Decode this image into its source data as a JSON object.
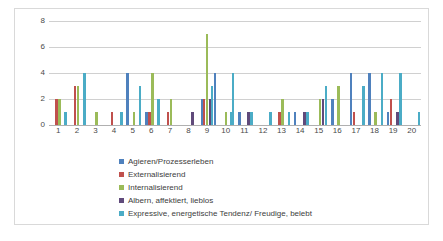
{
  "chart_data": {
    "type": "bar",
    "title": "",
    "subtitle": "",
    "xlabel": "",
    "ylabel": "",
    "ylim": [
      0,
      8
    ],
    "yticks": [
      0,
      2,
      4,
      6,
      8
    ],
    "grid": true,
    "legend_position": "bottom",
    "categories": [
      "1",
      "2",
      "3",
      "4",
      "5",
      "6",
      "7",
      "8",
      "9",
      "10",
      "11",
      "12",
      "13",
      "14",
      "15",
      "16",
      "17",
      "18",
      "19",
      "20"
    ],
    "series": [
      {
        "name": "Agieren/Prozesserleben",
        "color": "#4f81bd",
        "values": [
          0,
          0,
          0,
          0,
          4,
          1,
          0,
          0,
          2,
          0,
          1,
          0,
          0,
          1,
          0,
          2,
          4,
          4,
          1,
          0
        ]
      },
      {
        "name": "Externalisierend",
        "color": "#c0504d",
        "values": [
          2,
          3,
          0,
          1,
          0,
          1,
          1,
          0,
          2,
          0,
          0,
          0,
          1,
          0,
          0,
          0,
          1,
          0,
          2,
          0
        ]
      },
      {
        "name": "Internalisierend",
        "color": "#9bbb59",
        "values": [
          2,
          3,
          1,
          0,
          1,
          4,
          2,
          0,
          7,
          1,
          0,
          0,
          2,
          0,
          2,
          3,
          0,
          1,
          0,
          0
        ]
      },
      {
        "name": "Albern, affektiert, lieblos",
        "color": "#604a7b",
        "values": [
          0,
          0,
          0,
          0,
          0,
          0,
          0,
          1,
          2,
          0,
          1,
          0,
          0,
          1,
          2,
          0,
          0,
          0,
          1,
          0
        ]
      },
      {
        "name": "Expressive, energetische Tendenz/ Freudige, belebt",
        "color": "#4bacc6",
        "values": [
          1,
          4,
          0,
          1,
          3,
          2,
          0,
          0,
          3,
          1,
          1,
          1,
          1,
          1,
          3,
          0,
          3,
          4,
          4,
          1
        ]
      }
    ],
    "extra_bars": [
      {
        "category": "9",
        "series": "Agieren/Prozesserleben",
        "value": 4
      },
      {
        "category": "10",
        "series": "Expressive, energetische Tendenz/ Freudige, belebt",
        "value": 4
      }
    ]
  },
  "legend": {
    "items": [
      {
        "label": "Agieren/Prozesserleben",
        "color": "#4f81bd"
      },
      {
        "label": "Externalisierend",
        "color": "#c0504d"
      },
      {
        "label": "Internalisierend",
        "color": "#9bbb59"
      },
      {
        "label": "Albern, affektiert, lieblos",
        "color": "#604a7b"
      },
      {
        "label": "Expressive, energetische Tendenz/ Freudige, belebt",
        "color": "#4bacc6"
      }
    ]
  },
  "axis": {
    "y_tick_labels": [
      "0",
      "2",
      "4",
      "6",
      "8"
    ],
    "x_tick_labels": [
      "1",
      "2",
      "3",
      "4",
      "5",
      "6",
      "7",
      "8",
      "9",
      "10",
      "11",
      "12",
      "13",
      "14",
      "15",
      "16",
      "17",
      "18",
      "19",
      "20"
    ]
  }
}
